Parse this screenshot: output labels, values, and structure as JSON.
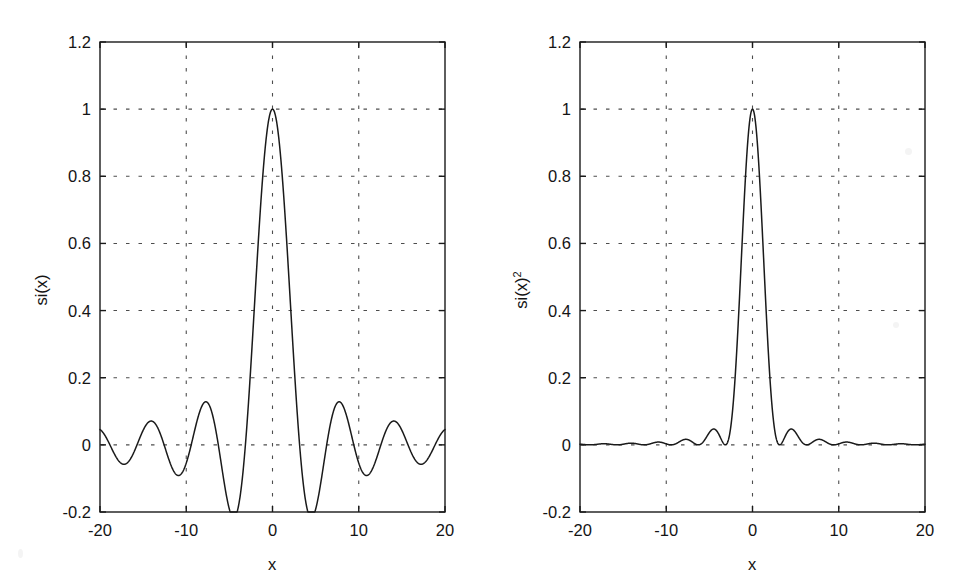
{
  "figure": {
    "background_color": "#ffffff",
    "line_color": "#1a1a1a",
    "axis_color": "#1a1a1a",
    "grid_color": "#4d4d4d"
  },
  "panels": [
    {
      "id": "left",
      "ylabel": "si(x)",
      "ylabel_superscript": "",
      "xlabel": "x"
    },
    {
      "id": "right",
      "ylabel": "si(x)",
      "ylabel_superscript": "2",
      "xlabel": "x"
    }
  ],
  "ticks": {
    "y_labels": [
      "1.2",
      "1",
      "0.8",
      "0.6",
      "0.4",
      "0.2",
      "0",
      "-0.2"
    ],
    "y_values": [
      1.2,
      1,
      0.8,
      0.6,
      0.4,
      0.2,
      0,
      -0.2
    ],
    "x_labels": [
      "-20",
      "-10",
      "0",
      "10",
      "20"
    ],
    "x_values": [
      -20,
      -10,
      0,
      10,
      20
    ]
  },
  "chart_data": [
    {
      "type": "line",
      "title": "",
      "subtitle": "",
      "xlabel": "x",
      "ylabel": "si(x)",
      "xlim": [
        -20,
        20
      ],
      "ylim": [
        -0.2,
        1.2
      ],
      "xticks": [
        -20,
        -10,
        0,
        10,
        20
      ],
      "yticks": [
        -0.2,
        0,
        0.2,
        0.4,
        0.6,
        0.8,
        1,
        1.2
      ],
      "grid": true,
      "grid_style": "dotted",
      "legend": null,
      "series": [
        {
          "name": "si(x)",
          "formula": "sin(x)/x",
          "peak_value": 1.0,
          "peak_x": 0,
          "zero_crossings": [
            -18.85,
            -15.71,
            -12.57,
            -9.42,
            -6.28,
            -3.14,
            3.14,
            6.28,
            9.42,
            12.57,
            15.71,
            18.85
          ],
          "sidelobe_extrema_x": [
            -17.22,
            -14.07,
            -10.9,
            -7.73,
            -4.49,
            4.49,
            7.73,
            10.9,
            14.07,
            17.22
          ],
          "sidelobe_extrema_y": [
            -0.058,
            0.071,
            -0.091,
            0.129,
            -0.217,
            -0.217,
            0.129,
            -0.091,
            0.071,
            -0.058
          ],
          "x": [
            -20,
            -19.5,
            -19,
            -18.85,
            -18.5,
            -18,
            -17.5,
            -17.22,
            -17,
            -16.5,
            -16,
            -15.71,
            -15.5,
            -15,
            -14.5,
            -14.07,
            -14,
            -13.5,
            -13,
            -12.57,
            -12.5,
            -12,
            -11.5,
            -11,
            -10.9,
            -10.5,
            -10,
            -9.5,
            -9.42,
            -9,
            -8.5,
            -8,
            -7.73,
            -7.5,
            -7,
            -6.5,
            -6.28,
            -6,
            -5.5,
            -5,
            -4.5,
            -4.49,
            -4,
            -3.5,
            -3.14,
            -3,
            -2.5,
            -2,
            -1.5,
            -1,
            -0.5,
            0,
            0.5,
            1,
            1.5,
            2,
            2.5,
            3,
            3.14,
            3.5,
            4,
            4.49,
            4.5,
            5,
            5.5,
            6,
            6.28,
            6.5,
            7,
            7.5,
            7.73,
            8,
            8.5,
            9,
            9.42,
            9.5,
            10,
            10.5,
            10.9,
            11,
            11.5,
            12,
            12.5,
            12.57,
            13,
            13.5,
            14,
            14.07,
            14.5,
            15,
            15.5,
            15.71,
            16,
            16.5,
            17,
            17.22,
            17.5,
            18,
            18.5,
            18.85,
            19,
            19.5,
            20
          ],
          "y": [
            0.0456,
            0.0394,
            0.0161,
            0.0,
            -0.0318,
            -0.0417,
            -0.0216,
            0.0,
            0.0168,
            0.0487,
            0.0179,
            0.0,
            -0.0304,
            -0.0434,
            -0.0233,
            0.0,
            0.0071,
            0.0467,
            0.0323,
            0.0,
            -0.0063,
            -0.0447,
            -0.0361,
            0.0,
            0.0161,
            0.0577,
            0.0544,
            0.0093,
            0.0,
            -0.0458,
            -0.0911,
            -0.0494,
            0.0,
            0.0125,
            0.0939,
            0.0331,
            0.0,
            -0.0466,
            -0.1281,
            -0.0767,
            0.0,
            0.0019,
            0.1892,
            0.1002,
            0.0,
            -0.047,
            -0.2394,
            -0.4546,
            0.665,
            0.8415,
            0.9589,
            1.0,
            0.9589,
            0.8415,
            0.665,
            0.4546,
            0.2394,
            0.047,
            0.0,
            -0.1002,
            -0.1892,
            -0.0019,
            0.0,
            0.0767,
            0.1281,
            0.0466,
            0.0,
            -0.0331,
            -0.0939,
            -0.0125,
            0.0,
            0.0494,
            0.0911,
            0.0458,
            0.0,
            -0.0093,
            -0.0544,
            -0.0577,
            0.0,
            -0.0161,
            0.0361,
            0.0447,
            0.0063,
            0.0,
            -0.0323,
            -0.0467,
            -0.0071,
            0.0,
            0.0233,
            0.0434,
            0.0304,
            0.0,
            -0.0179,
            -0.0487,
            -0.0168,
            0.0,
            0.0216,
            0.0417,
            0.0318,
            0.0,
            -0.0161,
            -0.0394,
            -0.0456
          ]
        }
      ]
    },
    {
      "type": "line",
      "title": "",
      "subtitle": "",
      "xlabel": "x",
      "ylabel": "si(x)^2",
      "xlim": [
        -20,
        20
      ],
      "ylim": [
        -0.2,
        1.2
      ],
      "xticks": [
        -20,
        -10,
        0,
        10,
        20
      ],
      "yticks": [
        -0.2,
        0,
        0.2,
        0.4,
        0.6,
        0.8,
        1,
        1.2
      ],
      "grid": true,
      "grid_style": "dotted",
      "legend": null,
      "series": [
        {
          "name": "si(x)^2",
          "formula": "(sin(x)/x)^2",
          "peak_value": 1.0,
          "peak_x": 0,
          "zero_crossings": [
            -18.85,
            -15.71,
            -12.57,
            -9.42,
            -6.28,
            -3.14,
            3.14,
            6.28,
            9.42,
            12.57,
            15.71,
            18.85
          ],
          "sidelobe_extrema_x": [
            -17.22,
            -14.07,
            -10.9,
            -7.73,
            -4.49,
            4.49,
            7.73,
            10.9,
            14.07,
            17.22
          ],
          "sidelobe_extrema_y": [
            0.0034,
            0.005,
            0.0083,
            0.0166,
            0.0472,
            0.0472,
            0.0166,
            0.0083,
            0.005,
            0.0034
          ]
        }
      ]
    }
  ]
}
